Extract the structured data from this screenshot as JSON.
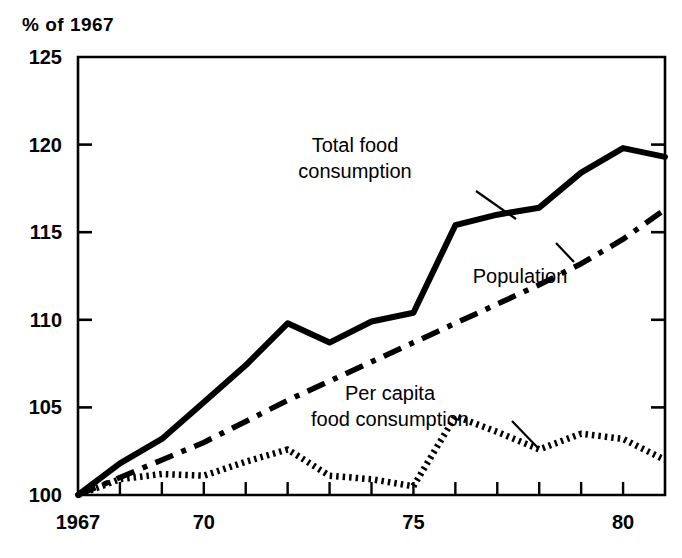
{
  "chart_data": {
    "type": "line",
    "title": "",
    "ylabel": "% of 1967",
    "xlabel": "",
    "ylim": [
      100,
      125
    ],
    "xlim": [
      1967,
      1981
    ],
    "grid": false,
    "legend_position": "inline-annotations",
    "y_ticks": [
      "100",
      "105",
      "110",
      "115",
      "120",
      "125"
    ],
    "y_tick_values": [
      100,
      105,
      110,
      115,
      120,
      125
    ],
    "x_ticks": [
      "1967",
      "70",
      "75",
      "80"
    ],
    "x_tick_values": [
      1967,
      1970,
      1975,
      1980
    ],
    "x_minor_values": [
      1968,
      1969,
      1971,
      1972,
      1973,
      1974,
      1976,
      1977,
      1978,
      1979,
      1981
    ],
    "x": [
      1967,
      1968,
      1969,
      1970,
      1971,
      1972,
      1973,
      1974,
      1975,
      1976,
      1977,
      1978,
      1979,
      1980,
      1981
    ],
    "series": [
      {
        "name": "Total food consumption",
        "style": "solid",
        "color": "#000000",
        "values": [
          100.0,
          101.8,
          103.2,
          105.3,
          107.4,
          109.8,
          108.7,
          109.9,
          110.4,
          115.4,
          116.0,
          116.4,
          118.4,
          119.8,
          119.3
        ]
      },
      {
        "name": "Population",
        "style": "dash-dot",
        "color": "#000000",
        "values": [
          100.0,
          101.0,
          102.0,
          103.0,
          104.2,
          105.4,
          106.5,
          107.6,
          108.7,
          109.8,
          110.9,
          112.0,
          113.2,
          114.6,
          116.3
        ]
      },
      {
        "name": "Per capita food consumption",
        "style": "dotted",
        "color": "#000000",
        "values": [
          100.0,
          100.9,
          101.2,
          101.1,
          101.9,
          102.6,
          101.1,
          100.9,
          100.5,
          104.5,
          103.6,
          102.6,
          103.5,
          103.2,
          102.0
        ]
      }
    ],
    "annotations": [
      {
        "label": "Total food consumption",
        "lines": [
          "Total food",
          "consumption"
        ],
        "text_x": 355,
        "text_y": 152,
        "leader_from": [
          476,
          191
        ],
        "leader_to": [
          516,
          219
        ]
      },
      {
        "label": "Population",
        "lines": [
          "Population"
        ],
        "text_x": 520,
        "text_y": 283,
        "leader_from": [
          574,
          262
        ],
        "leader_to": [
          556,
          243
        ]
      },
      {
        "label": "Per capita food consumption",
        "lines": [
          "Per capita",
          "food consumption"
        ],
        "text_x": 390,
        "text_y": 400,
        "leader_from": [
          512,
          421
        ],
        "leader_to": [
          538,
          448
        ]
      }
    ]
  },
  "plot_geometry": {
    "left": 78,
    "right": 665,
    "top": 57,
    "bottom": 495
  }
}
